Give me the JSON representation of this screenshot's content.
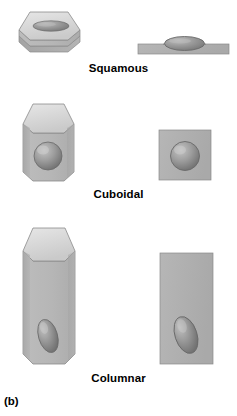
{
  "figure": {
    "caption": "(b)",
    "background_color": "#ffffff"
  },
  "palette": {
    "top_face": "#dcdcdc",
    "top_face_shade": "#cfcfcf",
    "front_face": "#b8b8b8",
    "side_face": "#a8a8a8",
    "outline": "#8a8a8a",
    "nucleus_light": "#b0b0b0",
    "nucleus_mid": "#8e8e8e",
    "nucleus_dark": "#6f6f6f",
    "section_fill": "#b2b2b2",
    "label_color": "#000000"
  },
  "cells": [
    {
      "id": "squamous",
      "label": "Squamous",
      "shape_3d": "flat hexagonal prism",
      "shape_2d": "thin horizontal bar",
      "nucleus_shape": "flattened ellipse"
    },
    {
      "id": "cuboidal",
      "label": "Cuboidal",
      "shape_3d": "cube-like hexagonal prism",
      "shape_2d": "square",
      "nucleus_shape": "sphere"
    },
    {
      "id": "columnar",
      "label": "Columnar",
      "shape_3d": "tall hexagonal prism",
      "shape_2d": "tall rectangle",
      "nucleus_shape": "tilted ovoid"
    }
  ]
}
